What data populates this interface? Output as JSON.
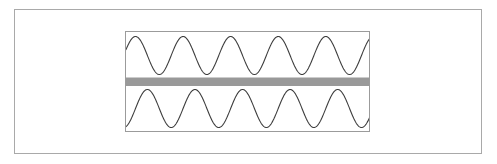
{
  "figure": {
    "title": "",
    "outer_frame": {
      "name": "outer-border",
      "border_color": "#a9a9a9",
      "fill_color": "#ffffff",
      "x": 14,
      "y": 9,
      "width": 468,
      "height": 145
    },
    "plot_panel": {
      "name": "waveform-panel",
      "border_color": "#9b9b9b",
      "fill_color": "#ffffff",
      "x": 125,
      "y": 31,
      "width": 245,
      "height": 101
    },
    "separator_band": {
      "name": "gray-separator-band",
      "color": "#999999",
      "edge_color": "#7d7d7d",
      "y_top": 45.5,
      "height": 8.5,
      "label": ""
    }
  },
  "chart_data": {
    "type": "line",
    "title": "",
    "subtitle": "",
    "xlabel": "",
    "ylabel": "",
    "grid": false,
    "legend": null,
    "axis_visible": false,
    "tick_labels_x": [],
    "tick_labels_y": [],
    "xlim": [
      0,
      245
    ],
    "ylim": [
      0,
      101
    ],
    "series": [
      {
        "name": "upper-waveform",
        "waveform": "sine",
        "cycles": 5.15,
        "amplitude": 19.0,
        "baseline_y": 23.5,
        "phase_deg": 18,
        "peaks": 5,
        "troughs": 5,
        "stroke_color": "#3d3d3d",
        "stroke_width": 1.1,
        "x_start": 0,
        "x_end": 245,
        "y_min": 4.5,
        "y_max": 42.5
      },
      {
        "name": "lower-waveform",
        "waveform": "sine",
        "cycles": 5.15,
        "amplitude": 19.0,
        "baseline_y": 76.5,
        "phase_deg": -72,
        "peaks": 5,
        "troughs": 5,
        "stroke_color": "#3d3d3d",
        "stroke_width": 1.1,
        "x_start": 0,
        "x_end": 245,
        "y_min": 57.5,
        "y_max": 95.5
      }
    ],
    "annotations": [
      {
        "name": "separator-band",
        "type": "hband",
        "y0": 45.5,
        "y1": 54.0,
        "color": "#999999"
      }
    ]
  }
}
